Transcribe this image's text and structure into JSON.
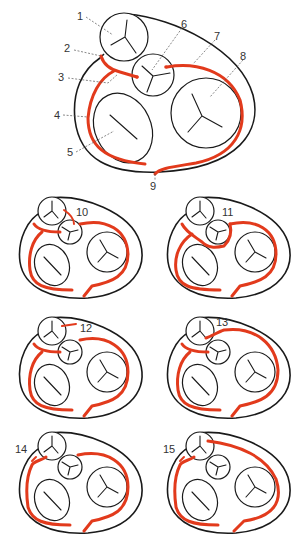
{
  "figure": {
    "colors": {
      "outline": "#1a1a1a",
      "artery": "#e23a1c",
      "label": "#333333"
    },
    "main_labels": [
      {
        "id": "1",
        "text": "1"
      },
      {
        "id": "2",
        "text": "2"
      },
      {
        "id": "3",
        "text": "3"
      },
      {
        "id": "4",
        "text": "4"
      },
      {
        "id": "5",
        "text": "5"
      },
      {
        "id": "6",
        "text": "6"
      },
      {
        "id": "7",
        "text": "7"
      },
      {
        "id": "8",
        "text": "8"
      },
      {
        "id": "9",
        "text": "9"
      }
    ],
    "panels": [
      {
        "id": "10",
        "label": "10"
      },
      {
        "id": "11",
        "label": "11"
      },
      {
        "id": "12",
        "label": "12"
      },
      {
        "id": "13",
        "label": "13"
      },
      {
        "id": "14",
        "label": "14"
      },
      {
        "id": "15",
        "label": "15"
      }
    ]
  }
}
